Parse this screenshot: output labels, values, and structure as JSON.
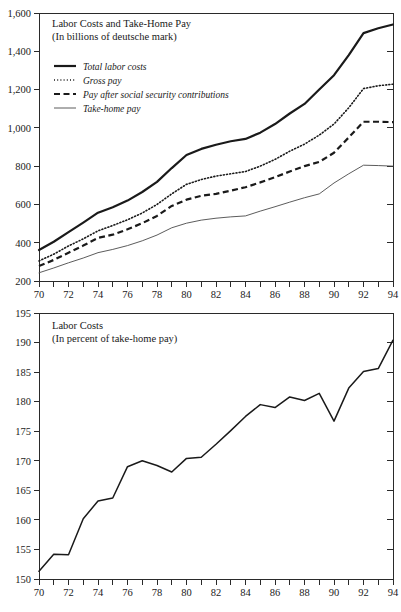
{
  "chart_data": [
    {
      "type": "line",
      "id": "labor-costs-levels",
      "title": "Labor Costs and Take-Home Pay",
      "subtitle": "(In billions of deutsche mark)",
      "xlabel": "",
      "ylabel": "",
      "xlim": [
        70,
        94
      ],
      "ylim": [
        200,
        1600
      ],
      "ytick_labels": [
        "1,600",
        "1,400",
        "1,200",
        "1,000",
        "800",
        "600",
        "400",
        "200"
      ],
      "ytick_values": [
        1600,
        1400,
        1200,
        1000,
        800,
        600,
        400,
        200
      ],
      "xtick_labels": [
        "70",
        "72",
        "74",
        "76",
        "78",
        "80",
        "82",
        "84",
        "86",
        "88",
        "90",
        "92",
        "94"
      ],
      "xtick_values": [
        70,
        72,
        74,
        76,
        78,
        80,
        82,
        84,
        86,
        88,
        90,
        92,
        94
      ],
      "minor_xticks": [
        71,
        73,
        75,
        77,
        79,
        81,
        83,
        85,
        87,
        89,
        91,
        93
      ],
      "grid": false,
      "legend_position": "upper-left-inside",
      "x": [
        70,
        71,
        72,
        73,
        74,
        75,
        76,
        77,
        78,
        79,
        80,
        81,
        82,
        83,
        84,
        85,
        86,
        87,
        88,
        89,
        90,
        91,
        92,
        93,
        94
      ],
      "series": [
        {
          "name": "Total labor costs",
          "style": "solid-thick",
          "values": [
            362,
            405,
            455,
            505,
            557,
            585,
            620,
            665,
            718,
            790,
            858,
            890,
            912,
            930,
            942,
            975,
            1020,
            1075,
            1125,
            1200,
            1275,
            1380,
            1495,
            1520,
            1540
          ]
        },
        {
          "name": "Gross pay",
          "style": "dotted",
          "values": [
            305,
            340,
            383,
            420,
            462,
            490,
            520,
            555,
            600,
            655,
            705,
            730,
            748,
            760,
            772,
            800,
            835,
            878,
            915,
            962,
            1020,
            1105,
            1205,
            1220,
            1228
          ]
        },
        {
          "name": "Pay after social security contributions",
          "style": "dashed",
          "values": [
            278,
            310,
            348,
            385,
            425,
            442,
            470,
            502,
            540,
            592,
            625,
            645,
            655,
            672,
            690,
            715,
            742,
            772,
            800,
            822,
            870,
            950,
            1032,
            1032,
            1030
          ]
        },
        {
          "name": "Take-home pay",
          "style": "solid-thin",
          "values": [
            243,
            268,
            295,
            320,
            348,
            365,
            385,
            410,
            440,
            478,
            502,
            518,
            528,
            535,
            540,
            565,
            588,
            612,
            635,
            655,
            712,
            760,
            805,
            803,
            800
          ]
        }
      ]
    },
    {
      "type": "line",
      "id": "labor-costs-ratio",
      "title": "Labor Costs",
      "subtitle": "(In percent of take-home pay)",
      "xlabel": "",
      "ylabel": "",
      "xlim": [
        70,
        94
      ],
      "ylim": [
        150,
        195
      ],
      "ytick_labels": [
        "195",
        "190",
        "185",
        "180",
        "175",
        "170",
        "165",
        "160",
        "155",
        "150"
      ],
      "ytick_values": [
        195,
        190,
        185,
        180,
        175,
        170,
        165,
        160,
        155,
        150
      ],
      "xtick_labels": [
        "70",
        "72",
        "74",
        "76",
        "78",
        "80",
        "82",
        "84",
        "86",
        "88",
        "90",
        "92",
        "94"
      ],
      "xtick_values": [
        70,
        72,
        74,
        76,
        78,
        80,
        82,
        84,
        86,
        88,
        90,
        92,
        94
      ],
      "minor_xticks": [
        71,
        73,
        75,
        77,
        79,
        81,
        83,
        85,
        87,
        89,
        91,
        93
      ],
      "grid": false,
      "legend_position": "none",
      "x": [
        70,
        71,
        72,
        73,
        74,
        75,
        76,
        77,
        78,
        79,
        80,
        81,
        82,
        83,
        84,
        85,
        86,
        87,
        88,
        89,
        90,
        91,
        92,
        93,
        94
      ],
      "series": [
        {
          "name": "Labor costs in percent of take-home pay",
          "style": "solid",
          "values": [
            151.3,
            154.2,
            154.1,
            160.2,
            163.2,
            163.7,
            169.0,
            170.0,
            169.2,
            168.1,
            170.4,
            170.6,
            172.8,
            175.1,
            177.5,
            179.5,
            179.0,
            180.8,
            180.2,
            181.4,
            176.7,
            182.3,
            185.1,
            185.6,
            190.4
          ]
        }
      ]
    }
  ],
  "colors": {
    "ink": "#1a1a1a",
    "axis": "#2a2a2a",
    "thin_line": "#4a4a4a",
    "background": "#ffffff"
  }
}
